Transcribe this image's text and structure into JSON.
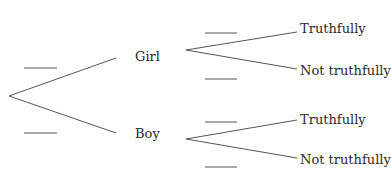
{
  "diagram": {
    "type": "probability-tree",
    "level1": [
      {
        "label": "Girl",
        "blank": ""
      },
      {
        "label": "Boy",
        "blank": ""
      }
    ],
    "level2": {
      "girl": [
        {
          "label": "Truthfully",
          "blank": ""
        },
        {
          "label": "Not truthfully",
          "blank": ""
        }
      ],
      "boy": [
        {
          "label": "Truthfully",
          "blank": ""
        },
        {
          "label": "Not truthfully",
          "blank": ""
        }
      ]
    },
    "line_color": "#555555",
    "text_color": "#2a2a2a"
  }
}
